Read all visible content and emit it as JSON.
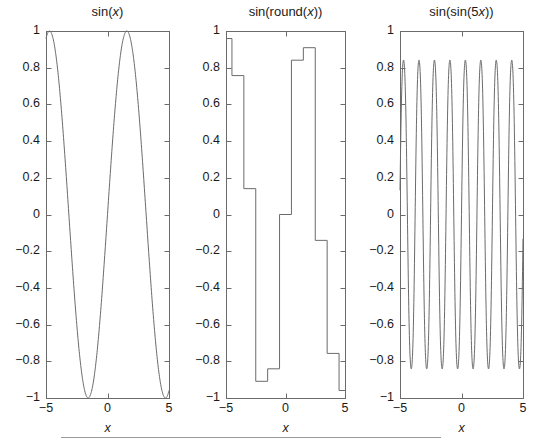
{
  "figure": {
    "width": 542,
    "height": 447,
    "background": "#ffffff",
    "line_color": "#6b6b6b",
    "axis_color": "#6b6b6b",
    "text_color": "#1a1a1a"
  },
  "panels": [
    {
      "name": "panel-sin-x",
      "title": "sin(x)",
      "title_parts": {
        "prefix": "sin(",
        "var": "x",
        "suffix": ")"
      },
      "xlabel": "x",
      "xticks": [
        -5,
        0,
        5
      ],
      "xtick_labels": [
        "−5",
        "0",
        "5"
      ],
      "yticks": [
        -1,
        -0.8,
        -0.6,
        -0.4,
        -0.2,
        0,
        0.2,
        0.4,
        0.6,
        0.8,
        1
      ],
      "ytick_labels": [
        "−1",
        "−0.8",
        "−0.6",
        "−0.4",
        "−0.2",
        "0",
        "0.2",
        "0.4",
        "0.6",
        "0.8",
        "1"
      ],
      "xlim": [
        -5,
        5
      ],
      "ylim": [
        -1,
        1
      ],
      "show_ytick_labels": true,
      "geom": {
        "left": 46,
        "right": 169,
        "top": 31,
        "bottom": 398
      }
    },
    {
      "name": "panel-sin-round-x",
      "title": "sin(round(x))",
      "title_parts": {
        "prefix": "sin(round(",
        "var": "x",
        "suffix": "))"
      },
      "xlabel": "x",
      "xticks": [
        -5,
        0,
        5
      ],
      "xtick_labels": [
        "−5",
        "0",
        "5"
      ],
      "yticks": [
        -1,
        -0.8,
        -0.6,
        -0.4,
        -0.2,
        0,
        0.2,
        0.4,
        0.6,
        0.8,
        1
      ],
      "ytick_labels": [
        "−1",
        "−0.8",
        "−0.6",
        "−0.4",
        "−0.2",
        "0",
        "0.2",
        "0.4",
        "0.6",
        "0.8",
        "1"
      ],
      "xlim": [
        -5,
        5
      ],
      "ylim": [
        -1,
        1
      ],
      "show_ytick_labels": true,
      "geom": {
        "left": 226,
        "right": 345,
        "top": 31,
        "bottom": 398
      }
    },
    {
      "name": "panel-sin-sin-5x",
      "title": "sin(sin(5x))",
      "title_parts": {
        "prefix": "sin(sin(5",
        "var": "x",
        "suffix": "))"
      },
      "xlabel": "x",
      "xticks": [
        -5,
        0,
        5
      ],
      "xtick_labels": [
        "−5",
        "0",
        "5"
      ],
      "yticks": [
        -1,
        -0.8,
        -0.6,
        -0.4,
        -0.2,
        0,
        0.2,
        0.4,
        0.6,
        0.8,
        1
      ],
      "ytick_labels": [
        "−1",
        "−0.8",
        "−0.6",
        "−0.4",
        "−0.2",
        "0",
        "0.2",
        "0.4",
        "0.6",
        "0.8",
        "1"
      ],
      "xlim": [
        -5,
        5
      ],
      "ylim": [
        -1,
        1
      ],
      "show_ytick_labels": true,
      "geom": {
        "left": 400,
        "right": 523,
        "top": 31,
        "bottom": 398
      }
    }
  ],
  "chart_data": [
    {
      "type": "line",
      "title": "sin(x)",
      "xlabel": "x",
      "ylabel": "",
      "xlim": [
        -5,
        5
      ],
      "ylim": [
        -1,
        1
      ],
      "grid": false,
      "legend": "none",
      "function": "sin(x)",
      "samples": 400,
      "annotations": [
        "Two full maxima near x = -4.7 and x = 1.6; minima near x = -1.6 and x = 4.7"
      ]
    },
    {
      "type": "line",
      "title": "sin(round(x))",
      "xlabel": "x",
      "ylabel": "",
      "xlim": [
        -5,
        5
      ],
      "ylim": [
        -1,
        1
      ],
      "grid": false,
      "legend": "none",
      "function": "sin(round(x))",
      "step": true,
      "step_x": [
        -5,
        -4,
        -3,
        -2,
        -1,
        0,
        1,
        2,
        3,
        4,
        5
      ],
      "step_y": [
        0.959,
        0.757,
        0.141,
        -0.909,
        -0.841,
        0.0,
        0.841,
        0.909,
        -0.141,
        -0.757,
        -0.959
      ],
      "plateaus": [
        {
          "x_range": [
            -5,
            -4.5
          ],
          "y": 0.959
        },
        {
          "x_range": [
            -4.5,
            -3.5
          ],
          "y": 0.757
        },
        {
          "x_range": [
            -3.5,
            -2.5
          ],
          "y": 0.141
        },
        {
          "x_range": [
            -2.5,
            -1.5
          ],
          "y": -0.909
        },
        {
          "x_range": [
            -1.5,
            -0.5
          ],
          "y": -0.841
        },
        {
          "x_range": [
            -0.5,
            0.5
          ],
          "y": 0.0
        },
        {
          "x_range": [
            0.5,
            1.5
          ],
          "y": 0.841
        },
        {
          "x_range": [
            1.5,
            2.5
          ],
          "y": 0.909
        },
        {
          "x_range": [
            2.5,
            3.5
          ],
          "y": -0.141
        },
        {
          "x_range": [
            3.5,
            4.5
          ],
          "y": -0.757
        },
        {
          "x_range": [
            4.5,
            5
          ],
          "y": -0.959
        }
      ],
      "annotations": [
        "Piecewise-constant staircase with vertical jumps at half-integer x"
      ]
    },
    {
      "type": "line",
      "title": "sin(sin(5x))",
      "xlabel": "x",
      "ylabel": "",
      "xlim": [
        -5,
        5
      ],
      "ylim": [
        -1,
        1
      ],
      "grid": false,
      "legend": "none",
      "function": "sin(sin(5x))",
      "samples": 800,
      "peak_value": 0.841,
      "trough_value": -0.841,
      "period": 1.2566,
      "annotations": [
        "Rapid oscillation, roughly 8 full cycles across the interval; extrema clipped at ±0.841"
      ]
    }
  ],
  "bottom_rule": {
    "name": "horizontal-rule",
    "visible": true
  }
}
